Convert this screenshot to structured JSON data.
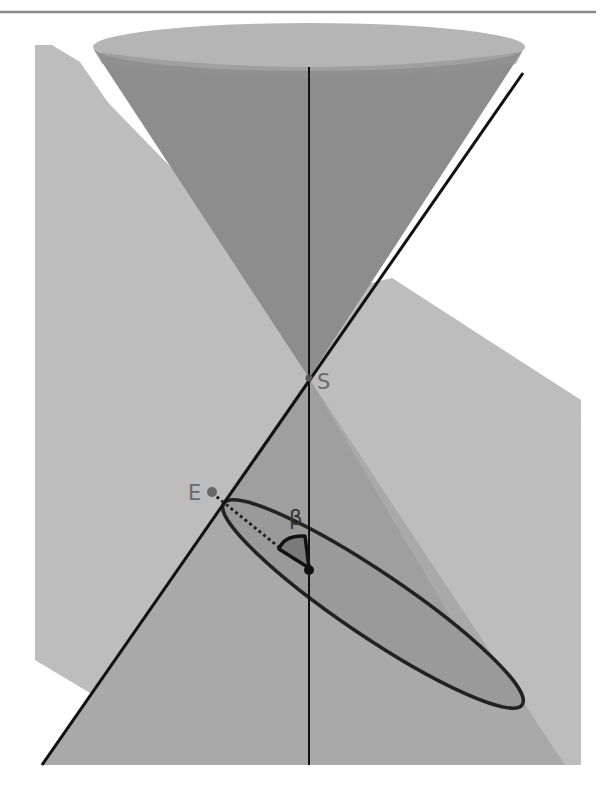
{
  "figure": {
    "type": "double cone cut by a plane (conic section: ellipse)",
    "labels": {
      "apex": "S",
      "ellipse_vertex": "E",
      "angle": "β"
    },
    "colors": {
      "background": "#ffffff",
      "top_rule": "#8a8a8a",
      "plane": "#bdbdbd",
      "cone_inner": "#8c8c8c",
      "cone_rim_top": "#b4b4b4",
      "lower_cone": "#a8a8a8",
      "ellipse_fill": "#999999",
      "ellipse_stroke": "#1e1e1e",
      "lines": "#111111",
      "label_gray": "#6a6a6a",
      "label_dark": "#333333",
      "angle_marker": "#7a7a7a"
    }
  }
}
